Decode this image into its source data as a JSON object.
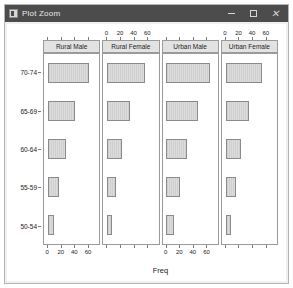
{
  "window": {
    "title": "Plot Zoom",
    "icon": "plot-window-icon",
    "controls": {
      "minimize": "minimize-icon",
      "maximize": "maximize-icon",
      "close": "close-icon"
    }
  },
  "chart_data": {
    "type": "bar",
    "title": "",
    "xlabel": "Freq",
    "ylabel": "",
    "orientation": "horizontal",
    "xlim": [
      -6,
      78
    ],
    "xticks": [
      0,
      20,
      40,
      60
    ],
    "xtick_labels": [
      "0",
      "20",
      "40",
      "60"
    ],
    "categories": [
      "70-74",
      "65-69",
      "60-64",
      "55-59",
      "50-54"
    ],
    "grid": false,
    "legend": "none",
    "axis_label_panels_top": [
      2,
      4
    ],
    "axis_label_panels_bottom": [
      1,
      3
    ],
    "panels": [
      {
        "label": "Rural Male",
        "values": [
          63,
          41,
          27,
          17,
          9
        ]
      },
      {
        "label": "Rural Female",
        "values": [
          57,
          34,
          23,
          14,
          8
        ]
      },
      {
        "label": "Urban Male",
        "values": [
          66,
          48,
          31,
          21,
          11
        ]
      },
      {
        "label": "Urban Female",
        "values": [
          55,
          36,
          24,
          16,
          8
        ]
      }
    ]
  },
  "colors": {
    "titlebar": "#4c4c4c",
    "bar_fill": "#d2d2d2",
    "bar_border": "#8a8a8a",
    "strip_fill": "#e2e2e2",
    "panel_border": "#9a9a9a",
    "plot_background": "#ffffff"
  }
}
